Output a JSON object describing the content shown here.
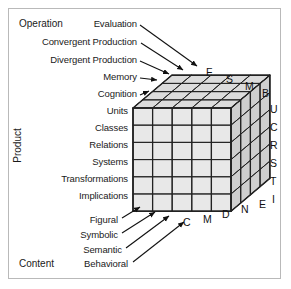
{
  "figure": {
    "background": "#ffffff",
    "frame_color": "#b9b9b9",
    "cube_face_color": "#e8e8e8",
    "cube_top_color": "#dcdcdc",
    "cube_side_color": "#cfcfcf",
    "cube_line_color": "#222222"
  },
  "axes": {
    "operation": {
      "title": "Operation",
      "labels": [
        "Evaluation",
        "Convergent Production",
        "Divergent Production",
        "Memory",
        "Cognition"
      ],
      "initials": [
        "C",
        "M",
        "D",
        "N",
        "E"
      ]
    },
    "product": {
      "title": "Product",
      "labels": [
        "Units",
        "Classes",
        "Relations",
        "Systems",
        "Transformations",
        "Implications"
      ],
      "initials": [
        "U",
        "C",
        "R",
        "S",
        "T",
        "I"
      ]
    },
    "content": {
      "title": "Content",
      "labels": [
        "Figural",
        "Symbolic",
        "Semantic",
        "Behavioral"
      ],
      "initials": [
        "F",
        "S",
        "M",
        "B"
      ]
    }
  },
  "chart_data": {
    "type": "diagram",
    "dimensions": {
      "operations": 5,
      "products": 6,
      "contents": 4
    },
    "total_cells": 120
  }
}
